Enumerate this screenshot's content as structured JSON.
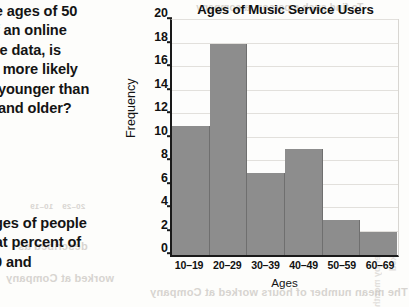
{
  "question_top": {
    "lines": [
      "he ages of 50",
      "of an online",
      "the data, is",
      "te more likely",
      "e younger than",
      "0 and older?"
    ]
  },
  "question_bottom": {
    "lines": [
      "ages of people",
      "hat percent of",
      " 20 and"
    ]
  },
  "chart_data": {
    "type": "bar",
    "title": "Ages of Music Service Users",
    "xlabel": "Ages",
    "ylabel": "Frequency",
    "categories": [
      "10–19",
      "20–29",
      "30–39",
      "40–49",
      "50–59",
      "60–69"
    ],
    "values": [
      11,
      18,
      7,
      9,
      3,
      2
    ],
    "ylim": [
      0,
      20
    ],
    "yticks": [
      0,
      2,
      4,
      6,
      8,
      10,
      12,
      14,
      16,
      18,
      20
    ],
    "ytick_labels": [
      "0",
      "2",
      "4",
      "6",
      "8",
      "10",
      "12",
      "14",
      "16",
      "18",
      "20"
    ],
    "grid": true,
    "legend": false,
    "bar_color": "#8d8d8d",
    "axis_color": "#1a1a1a",
    "background": "#fdfdfc"
  },
  "bleed_through": {
    "items": [
      {
        "text": "To find such a person, a company",
        "x": 196,
        "y": 2,
        "size": 10
      },
      {
        "text": "Company A",
        "x": 232,
        "y": 40,
        "size": 10
      },
      {
        "text": "40 to 49",
        "x": 248,
        "y": 196,
        "size": 9
      },
      {
        "text": "50 to 59",
        "x": 196,
        "y": 196,
        "size": 9
      },
      {
        "text": "20–29",
        "x": 62,
        "y": 202,
        "size": 8
      },
      {
        "text": "10–19",
        "x": 30,
        "y": 202,
        "size": 8
      },
      {
        "text": "described as",
        "x": 18,
        "y": 240,
        "size": 11
      },
      {
        "text": "The mean number of hours worked at Company",
        "x": 150,
        "y": 286,
        "size": 11
      },
      {
        "text": "worked at Company",
        "x": 6,
        "y": 272,
        "size": 11
      }
    ],
    "vertical": [
      {
        "text": "Number by month",
        "x": 372,
        "y": 230,
        "size": 9
      },
      {
        "text": "hours worked",
        "x": 388,
        "y": 212,
        "size": 9
      }
    ]
  }
}
